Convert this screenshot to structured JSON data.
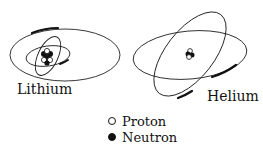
{
  "atoms": [
    {
      "name": "Lithium",
      "label": "Lithium",
      "protons": 3,
      "neutrons": 4,
      "electrons": 3
    },
    {
      "name": "Helium",
      "label": "Helium",
      "protons": 2,
      "neutrons": 2,
      "electrons": 2
    }
  ],
  "legend": {
    "items": [
      {
        "symbol": "open-circle",
        "label": "Proton"
      },
      {
        "symbol": "filled-circle",
        "label": "Neutron"
      }
    ]
  },
  "colors": {
    "ink": "#111111",
    "background": "#ffffff"
  }
}
